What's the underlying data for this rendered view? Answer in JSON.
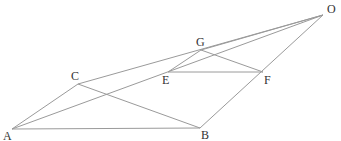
{
  "diagram": {
    "type": "geometric-figure",
    "colors": {
      "line": "#9a9a9a",
      "label": "#333333",
      "background": "#ffffff"
    },
    "points": [
      {
        "id": "A",
        "label": "A",
        "x": 12,
        "y": 129,
        "lx": 3,
        "ly": 140
      },
      {
        "id": "B",
        "label": "B",
        "x": 200,
        "y": 128,
        "lx": 201,
        "ly": 139
      },
      {
        "id": "C",
        "label": "C",
        "x": 78,
        "y": 84,
        "lx": 71,
        "ly": 80
      },
      {
        "id": "E",
        "label": "E",
        "x": 168,
        "y": 72,
        "lx": 162,
        "ly": 84
      },
      {
        "id": "F",
        "label": "F",
        "x": 263,
        "y": 72,
        "lx": 264,
        "ly": 84
      },
      {
        "id": "G",
        "label": "G",
        "x": 201,
        "y": 50,
        "lx": 196,
        "ly": 46
      },
      {
        "id": "O",
        "label": "O",
        "x": 323,
        "y": 15,
        "lx": 327,
        "ly": 13
      }
    ],
    "segments": [
      [
        "A",
        "B"
      ],
      [
        "A",
        "C"
      ],
      [
        "C",
        "B"
      ],
      [
        "C",
        "O"
      ],
      [
        "A",
        "O"
      ],
      [
        "B",
        "O"
      ],
      [
        "E",
        "F"
      ],
      [
        "E",
        "G"
      ],
      [
        "G",
        "F"
      ],
      [
        "G",
        "O"
      ]
    ]
  }
}
